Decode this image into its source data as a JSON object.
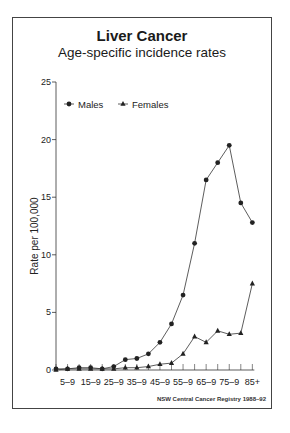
{
  "chart_data": {
    "type": "line",
    "title": "Liver Cancer",
    "subtitle": "Age-specific incidence rates",
    "xlabel": "",
    "ylabel": "Rate per 100,000",
    "ylim": [
      0,
      25
    ],
    "yticks": [
      0,
      5,
      10,
      15,
      20,
      25
    ],
    "categories": [
      "0–4",
      "5–9",
      "10–14",
      "15–19",
      "20–24",
      "25–29",
      "30–34",
      "35–39",
      "40–44",
      "45–49",
      "50–54",
      "55–59",
      "60–64",
      "65–69",
      "70–74",
      "75–79",
      "80–84",
      "85+"
    ],
    "xtick_labels": [
      "5–9",
      "15–9",
      "25–9",
      "35–9",
      "45–9",
      "55–9",
      "65–9",
      "75–9",
      "85+"
    ],
    "grid": false,
    "legend_position": "top-left",
    "series": [
      {
        "name": "Males",
        "marker": "circle",
        "values": [
          0.1,
          0.1,
          0.2,
          0.2,
          0.1,
          0.3,
          0.9,
          1.0,
          1.4,
          2.4,
          4.0,
          6.5,
          11.0,
          16.5,
          18.0,
          19.5,
          14.5,
          12.8
        ]
      },
      {
        "name": "Females",
        "marker": "triangle",
        "values": [
          0.0,
          0.1,
          0.1,
          0.1,
          0.1,
          0.1,
          0.2,
          0.2,
          0.3,
          0.5,
          0.6,
          1.4,
          2.9,
          2.4,
          3.4,
          3.1,
          3.2,
          7.5
        ]
      }
    ],
    "source": "NSW Central Cancer Registry 1988–92"
  },
  "labels": {
    "title": "Liver Cancer",
    "subtitle": "Age-specific incidence rates",
    "ylabel": "Rate per 100,000",
    "legend_males": "Males",
    "legend_females": "Females",
    "footer": "NSW Central Cancer Registry 1988–92"
  }
}
